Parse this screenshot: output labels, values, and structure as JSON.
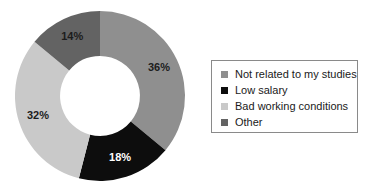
{
  "chart_data": {
    "type": "pie",
    "variant": "donut",
    "title": "",
    "subtitle": "",
    "xlabel": "",
    "ylabel": "",
    "grid": false,
    "legend_position": "right",
    "start_angle_deg": 0,
    "direction": "clockwise",
    "inner_radius_ratio": 0.47,
    "categories": [
      "Not related to my studies",
      "Low salary",
      "Bad working conditions",
      "Other"
    ],
    "values": [
      36,
      18,
      32,
      14
    ],
    "value_labels": [
      "36%",
      "18%",
      "32%",
      "14%"
    ],
    "colors": [
      "#8f8f8f",
      "#0d0d0d",
      "#c9c9c9",
      "#636363"
    ],
    "label_text_colors": [
      "#1c1c1c",
      "#ffffff",
      "#1c1c1c",
      "#1c1c1c"
    ],
    "slices": [
      {
        "label": "Not related to my studies",
        "value": 36,
        "value_label": "36%",
        "color": "#8f8f8f",
        "label_color": "#1c1c1c"
      },
      {
        "label": "Low salary",
        "value": 18,
        "value_label": "18%",
        "color": "#0d0d0d",
        "label_color": "#ffffff"
      },
      {
        "label": "Bad working conditions",
        "value": 32,
        "value_label": "32%",
        "color": "#c9c9c9",
        "label_color": "#1c1c1c"
      },
      {
        "label": "Other",
        "value": 14,
        "value_label": "14%",
        "color": "#636363",
        "label_color": "#1c1c1c"
      }
    ]
  },
  "legend": {
    "border_color": "#8a8a8a",
    "items": [
      {
        "label": "Not related to my studies",
        "color": "#8f8f8f"
      },
      {
        "label": "Low salary",
        "color": "#0d0d0d"
      },
      {
        "label": "Bad working conditions",
        "color": "#c9c9c9"
      },
      {
        "label": "Other",
        "color": "#636363"
      }
    ]
  }
}
